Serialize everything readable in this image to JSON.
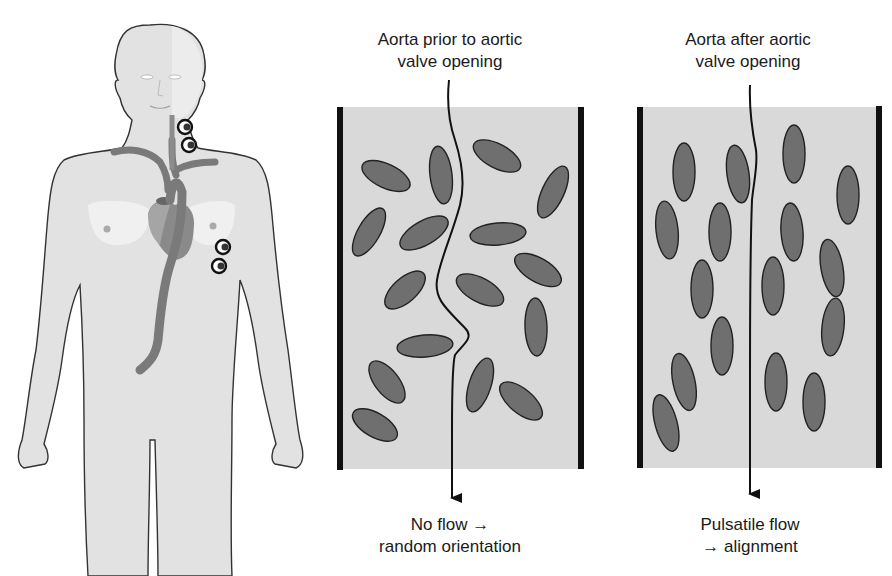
{
  "figure": {
    "left_panel": {
      "title_line1": "Aorta prior to aortic",
      "title_line2": "valve opening",
      "caption_line1": "No flow →",
      "caption_line2": "random orientation"
    },
    "right_panel": {
      "title_line1": "Aorta after aortic",
      "title_line2": "valve opening",
      "caption_line1": "Pulsatile flow",
      "caption_line2": "→ alignment"
    },
    "body_illustration": {
      "description": "Human torso with aorta, heart and two pairs of electrodes (neck and left chest)"
    },
    "colors": {
      "panel_fill": "#d9d9d9",
      "wall": "#111111",
      "cell_fill": "#6f6f6f",
      "cell_stroke": "#222222",
      "body_fill": "#e2e2e2",
      "aorta": "#7a7a7a"
    }
  }
}
